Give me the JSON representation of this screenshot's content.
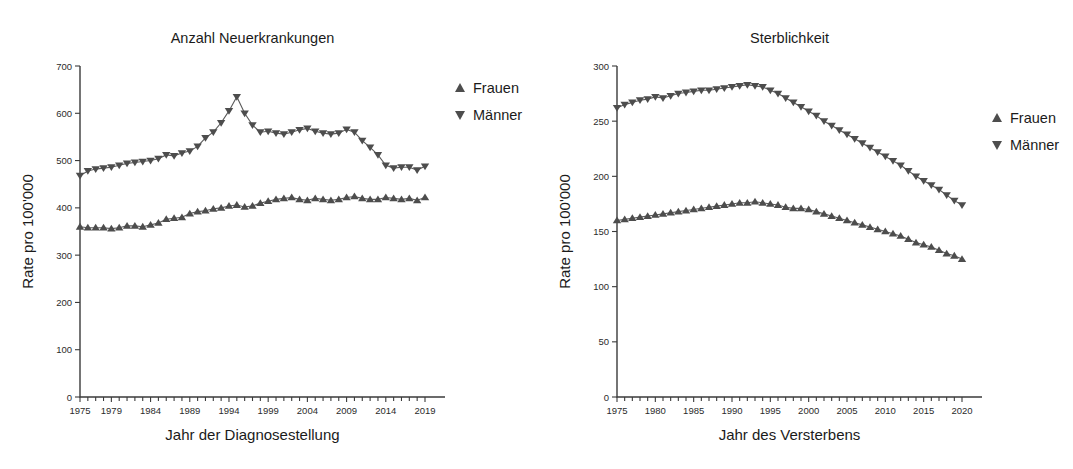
{
  "figure": {
    "legend_labels": [
      "Frauen",
      "Männer"
    ],
    "marker_color": "#4d4d4d",
    "axis_color": "#3b3b3b",
    "background": "#ffffff"
  },
  "chart_data": [
    {
      "id": "incidence",
      "type": "line",
      "title": "Anzahl Neuerkrankungen",
      "xlabel": "Jahr der Diagnosestellung",
      "ylabel": "Rate pro 100'000",
      "xlim": [
        1975,
        2019
      ],
      "ylim": [
        0,
        700
      ],
      "yticks": [
        0,
        100,
        200,
        300,
        400,
        500,
        600,
        700
      ],
      "xticks": [
        1975,
        1979,
        1984,
        1989,
        1994,
        1999,
        2004,
        2009,
        2014,
        2019
      ],
      "grid": false,
      "legend_position": "right",
      "x": [
        1975,
        1976,
        1977,
        1978,
        1979,
        1980,
        1981,
        1982,
        1983,
        1984,
        1985,
        1986,
        1987,
        1988,
        1989,
        1990,
        1991,
        1992,
        1993,
        1994,
        1995,
        1996,
        1997,
        1998,
        1999,
        2000,
        2001,
        2002,
        2003,
        2004,
        2005,
        2006,
        2007,
        2008,
        2009,
        2010,
        2011,
        2012,
        2013,
        2014,
        2015,
        2016,
        2017,
        2018,
        2019
      ],
      "series": [
        {
          "name": "Männer",
          "marker": "triangle-down",
          "values": [
            468,
            478,
            482,
            484,
            486,
            490,
            494,
            496,
            498,
            500,
            504,
            512,
            510,
            516,
            520,
            530,
            548,
            560,
            580,
            605,
            635,
            600,
            575,
            560,
            562,
            558,
            556,
            560,
            565,
            568,
            562,
            558,
            556,
            558,
            566,
            560,
            542,
            528,
            512,
            490,
            484,
            486,
            486,
            480,
            488
          ]
        },
        {
          "name": "Frauen",
          "marker": "triangle-up",
          "values": [
            360,
            358,
            358,
            358,
            356,
            358,
            362,
            362,
            360,
            364,
            368,
            376,
            378,
            380,
            388,
            392,
            394,
            398,
            400,
            404,
            406,
            402,
            404,
            410,
            414,
            418,
            420,
            422,
            418,
            416,
            420,
            418,
            416,
            418,
            422,
            424,
            420,
            418,
            418,
            422,
            420,
            418,
            420,
            416,
            422
          ]
        }
      ]
    },
    {
      "id": "mortality",
      "type": "line",
      "title": "Sterblichkeit",
      "xlabel": "Jahr des Versterbens",
      "ylabel": "Rate pro 100'000",
      "xlim": [
        1975,
        2020
      ],
      "ylim": [
        0,
        300
      ],
      "yticks": [
        0,
        50,
        100,
        150,
        200,
        250,
        300
      ],
      "xticks": [
        1975,
        1980,
        1985,
        1990,
        1995,
        2000,
        2005,
        2010,
        2015,
        2020
      ],
      "grid": false,
      "legend_position": "right",
      "x": [
        1975,
        1976,
        1977,
        1978,
        1979,
        1980,
        1981,
        1982,
        1983,
        1984,
        1985,
        1986,
        1987,
        1988,
        1989,
        1990,
        1991,
        1992,
        1993,
        1994,
        1995,
        1996,
        1997,
        1998,
        1999,
        2000,
        2001,
        2002,
        2003,
        2004,
        2005,
        2006,
        2007,
        2008,
        2009,
        2010,
        2011,
        2012,
        2013,
        2014,
        2015,
        2016,
        2017,
        2018,
        2019,
        2020
      ],
      "series": [
        {
          "name": "Männer",
          "marker": "triangle-down",
          "values": [
            262,
            265,
            267,
            269,
            270,
            272,
            271,
            273,
            275,
            276,
            277,
            278,
            278,
            279,
            280,
            281,
            282,
            283,
            282,
            281,
            278,
            275,
            271,
            267,
            263,
            259,
            255,
            250,
            246,
            242,
            238,
            234,
            230,
            226,
            222,
            218,
            214,
            210,
            205,
            200,
            196,
            192,
            188,
            183,
            178,
            174
          ]
        },
        {
          "name": "Frauen",
          "marker": "triangle-up",
          "values": [
            160,
            161,
            162,
            163,
            164,
            165,
            166,
            167,
            168,
            169,
            170,
            171,
            172,
            173,
            174,
            175,
            176,
            176,
            177,
            176,
            175,
            174,
            172,
            171,
            171,
            170,
            168,
            166,
            164,
            162,
            160,
            158,
            156,
            154,
            152,
            150,
            148,
            146,
            143,
            140,
            138,
            136,
            133,
            130,
            128,
            125
          ]
        }
      ]
    }
  ]
}
